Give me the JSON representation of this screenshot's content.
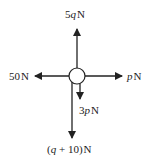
{
  "diagram": {
    "type": "free-body force diagram",
    "body": {
      "shape": "circle",
      "fill": "#ffffff",
      "stroke": "#222222"
    },
    "forces": [
      {
        "direction": "up",
        "label": "5q N",
        "coef": "5",
        "var": "q",
        "unit": "N"
      },
      {
        "direction": "left",
        "label": "50 N",
        "value": "50",
        "unit": "N"
      },
      {
        "direction": "right",
        "label": "p N",
        "var": "p",
        "unit": "N"
      },
      {
        "direction": "down",
        "label": "3p N",
        "coef": "3",
        "var": "p",
        "unit": "N"
      },
      {
        "direction": "down",
        "label": "(q + 10) N",
        "open": "(",
        "var": "q",
        "rest": " + 10)",
        "unit": "N"
      }
    ],
    "colors": {
      "stroke": "#222222",
      "background": "#ffffff"
    }
  }
}
